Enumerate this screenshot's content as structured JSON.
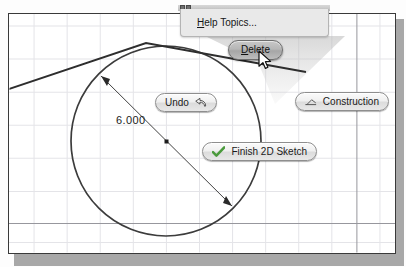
{
  "app": {
    "context": "cad-2d-sketch-canvas",
    "background_color": "#ffffff",
    "frame_border_color": "#3a3a3a",
    "grid_color": "#e2e2e6",
    "grid_major_color": "#9a9aa0",
    "geometry_color": "#3c3c3c"
  },
  "help_panel": {
    "label_prefix": "H",
    "label_rest": "elp Topics...",
    "label_full": "Help Topics..."
  },
  "marking_menu": {
    "delete": {
      "prefix": "D",
      "rest": "elete",
      "label": "Delete",
      "state": "highlighted"
    },
    "undo": {
      "label": "Undo",
      "icon": "undo-arrow-icon"
    },
    "construction": {
      "label": "Construction",
      "icon": "construction-line-icon"
    },
    "finish": {
      "label": "Finish 2D Sketch",
      "icon": "check-icon",
      "icon_color": "#4a9a3c"
    }
  },
  "sketch": {
    "dimension": {
      "value": "6.000",
      "type": "diameter"
    },
    "circle": {
      "cx": 166,
      "cy": 141,
      "r": 95
    },
    "dimension_line": {
      "x1": 101,
      "y1": 76,
      "x2": 232,
      "y2": 206
    },
    "tangent_polyline": "0,92 146,43 306,72",
    "midpoint_marker": {
      "x": 167,
      "y": 142
    }
  },
  "cursor": {
    "type": "arrow-pointer",
    "x": 258,
    "y": 50
  }
}
